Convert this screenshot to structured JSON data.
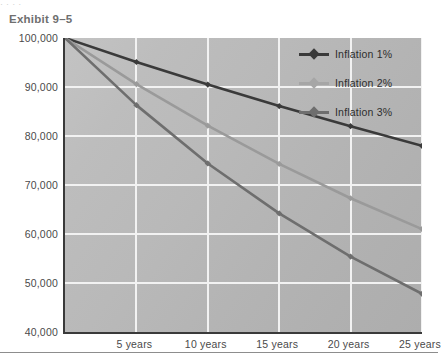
{
  "page": {
    "top_clip_text": "· · · ·",
    "title": "Exhibit 9–5"
  },
  "chart_data": {
    "type": "line",
    "title": "Exhibit 9–5",
    "xlabel": "",
    "ylabel": "",
    "x": [
      0,
      5,
      10,
      15,
      20,
      25
    ],
    "categories": [
      "",
      "5 years",
      "10 years",
      "15 years",
      "20 years",
      "25 years"
    ],
    "xtick_labels": [
      "5 years",
      "10 years",
      "15 years",
      "20 years",
      "25 years"
    ],
    "ytick_labels": [
      "100,000",
      "90,000",
      "80,000",
      "70,000",
      "60,000",
      "50,000",
      "40,000"
    ],
    "ylim": [
      40000,
      100000
    ],
    "ytick_values": [
      100000,
      90000,
      80000,
      70000,
      60000,
      50000,
      40000
    ],
    "grid": true,
    "legend_position": "top-right",
    "series": [
      {
        "name": "Inflation 1%",
        "color": "#3a3a3a",
        "values": [
          100000,
          95100,
          90500,
          86100,
          82000,
          78000
        ]
      },
      {
        "name": "Inflation 2%",
        "color": "#9a9a9a",
        "values": [
          100000,
          90600,
          82100,
          74300,
          67300,
          61000
        ]
      },
      {
        "name": "Inflation 3%",
        "color": "#6e6e6e",
        "values": [
          100000,
          86300,
          74400,
          64200,
          55400,
          47800
        ]
      }
    ]
  },
  "legend": {
    "items": [
      {
        "label": "Inflation 1%",
        "color": "#3a3a3a"
      },
      {
        "label": "Inflation 2%",
        "color": "#a6a6a6"
      },
      {
        "label": "Inflation 3%",
        "color": "#6e6e6e"
      }
    ]
  },
  "colors": {
    "plot_background_light": "#c3c3c3",
    "plot_background_dark": "#adadad",
    "gridline": "#f2f2f2",
    "axis": "#3a3a3a",
    "tick_text": "#4a4a4a",
    "title_text": "#6f6f6f",
    "rule": "#8d8d8d"
  }
}
